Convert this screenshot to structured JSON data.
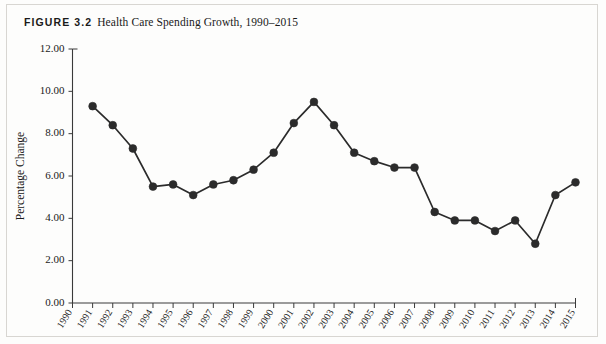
{
  "figure": {
    "label": "FIGURE 3.2",
    "title": "Health Care Spending Growth, 1990–2015"
  },
  "axes": {
    "ylabel": "Percentage Change",
    "ytick_labels": [
      "0.00",
      "2.00",
      "4.00",
      "6.00",
      "8.00",
      "10.00",
      "12.00"
    ],
    "xlabel": ""
  },
  "chart_data": {
    "type": "line",
    "title": "Health Care Spending Growth, 1990–2015",
    "xlabel": "",
    "ylabel": "Percentage Change",
    "ylim": [
      0.0,
      12.0
    ],
    "yticks": [
      0.0,
      2.0,
      4.0,
      6.0,
      8.0,
      10.0,
      12.0
    ],
    "grid": false,
    "legend": null,
    "marker": "filled-circle",
    "line_color": "#2b2b2b",
    "categories": [
      "1990",
      "1991",
      "1992",
      "1993",
      "1994",
      "1995",
      "1996",
      "1997",
      "1998",
      "1999",
      "2000",
      "2001",
      "2002",
      "2003",
      "2004",
      "2005",
      "2006",
      "2007",
      "2008",
      "2009",
      "2010",
      "2011",
      "2012",
      "2013",
      "2014",
      "2015"
    ],
    "values": [
      null,
      9.3,
      8.4,
      7.3,
      5.5,
      5.6,
      5.1,
      5.6,
      5.8,
      6.3,
      7.1,
      8.5,
      9.5,
      8.4,
      7.1,
      6.7,
      6.4,
      6.4,
      4.3,
      3.9,
      3.9,
      3.4,
      3.9,
      2.8,
      5.1,
      5.7
    ],
    "series": [
      {
        "name": "Health care spending growth",
        "values": [
          null,
          9.3,
          8.4,
          7.3,
          5.5,
          5.6,
          5.1,
          5.6,
          5.8,
          6.3,
          7.1,
          8.5,
          9.5,
          8.4,
          7.1,
          6.7,
          6.4,
          6.4,
          4.3,
          3.9,
          3.9,
          3.4,
          3.9,
          2.8,
          5.1,
          5.7
        ]
      }
    ]
  }
}
